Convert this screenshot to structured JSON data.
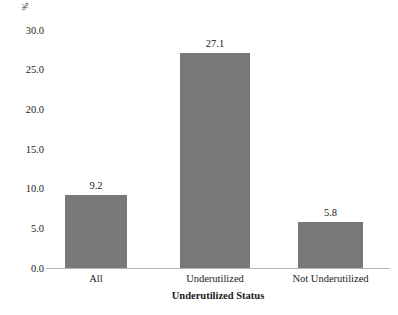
{
  "chart_data": {
    "type": "bar",
    "title": "",
    "subtitle": "",
    "categories": [
      "All",
      "Underutilized",
      "Not Underutilized"
    ],
    "values": [
      9.2,
      27.1,
      5.8
    ],
    "data_labels": [
      "9.2",
      "27.1",
      "5.8"
    ],
    "xlabel": "Underutilized Status",
    "ylabel": "%",
    "ylim": [
      0.0,
      30.0
    ],
    "ytick_labels": [
      "0.0",
      "5.0",
      "10.0",
      "15.0",
      "20.0",
      "25.0",
      "30.0"
    ],
    "ytick_values": [
      0.0,
      5.0,
      10.0,
      15.0,
      20.0,
      25.0,
      30.0
    ],
    "grid": false,
    "legend": null,
    "bar_color": "#787878",
    "axis_color": "#b4b4b4",
    "background_color": "#ffffff"
  },
  "axes": {
    "y_unit_label": "%",
    "x_title": "Underutilized Status"
  }
}
